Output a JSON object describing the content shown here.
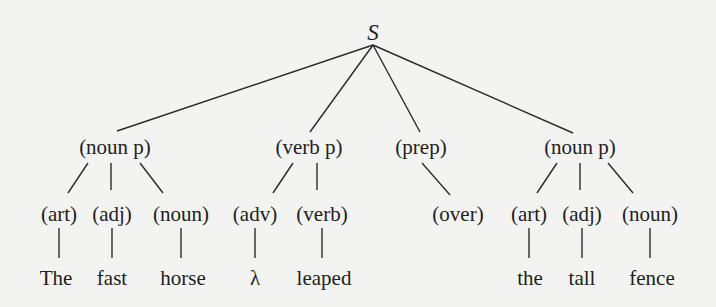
{
  "diagram": {
    "type": "parse-tree",
    "root": {
      "id": "S",
      "label": "S",
      "x": 373,
      "y": 40
    },
    "phrases": [
      {
        "id": "np1",
        "label": "(noun p)",
        "x": 115,
        "y": 154
      },
      {
        "id": "vp",
        "label": "(verb p)",
        "x": 309,
        "y": 154
      },
      {
        "id": "pp",
        "label": "(prep)",
        "x": 421,
        "y": 154
      },
      {
        "id": "np2",
        "label": "(noun p)",
        "x": 580,
        "y": 154
      }
    ],
    "tags": [
      {
        "id": "t1",
        "label": "(art)",
        "x": 59,
        "y": 221,
        "parent": "np1"
      },
      {
        "id": "t2",
        "label": "(adj)",
        "x": 112,
        "y": 221,
        "parent": "np1"
      },
      {
        "id": "t3",
        "label": "(noun)",
        "x": 181,
        "y": 221,
        "parent": "np1"
      },
      {
        "id": "t4",
        "label": "(adv)",
        "x": 255,
        "y": 221,
        "parent": "vp"
      },
      {
        "id": "t5",
        "label": "(verb)",
        "x": 322,
        "y": 221,
        "parent": "vp"
      },
      {
        "id": "t6",
        "label": "(over)",
        "x": 458,
        "y": 221,
        "parent": "pp"
      },
      {
        "id": "t7",
        "label": "(art)",
        "x": 529,
        "y": 221,
        "parent": "np2"
      },
      {
        "id": "t8",
        "label": "(adj)",
        "x": 582,
        "y": 221,
        "parent": "np2"
      },
      {
        "id": "t9",
        "label": "(noun)",
        "x": 650,
        "y": 221,
        "parent": "np2"
      }
    ],
    "words": [
      {
        "id": "w1",
        "label": "The",
        "x": 56,
        "y": 285,
        "parent": "t1"
      },
      {
        "id": "w2",
        "label": "fast",
        "x": 112,
        "y": 285,
        "parent": "t2"
      },
      {
        "id": "w3",
        "label": "horse",
        "x": 183,
        "y": 285,
        "parent": "t3"
      },
      {
        "id": "w4",
        "label": "λ",
        "x": 255,
        "y": 285,
        "parent": "t4"
      },
      {
        "id": "w5",
        "label": "leaped",
        "x": 324,
        "y": 285,
        "parent": "t5"
      },
      {
        "id": "w6",
        "label": "the",
        "x": 530,
        "y": 285,
        "parent": "t7"
      },
      {
        "id": "w7",
        "label": "tall",
        "x": 582,
        "y": 285,
        "parent": "t8"
      },
      {
        "id": "w8",
        "label": "fence",
        "x": 652,
        "y": 285,
        "parent": "t9"
      }
    ],
    "edges": [
      {
        "from": "S",
        "to": "np1",
        "x1": 373,
        "y1": 45,
        "x2": 117,
        "y2": 131
      },
      {
        "from": "S",
        "to": "vp",
        "x1": 373,
        "y1": 45,
        "x2": 310,
        "y2": 132
      },
      {
        "from": "S",
        "to": "pp",
        "x1": 373,
        "y1": 45,
        "x2": 420,
        "y2": 132
      },
      {
        "from": "S",
        "to": "np2",
        "x1": 373,
        "y1": 45,
        "x2": 573,
        "y2": 133
      },
      {
        "from": "np1",
        "to": "t1",
        "x1": 88,
        "y1": 163,
        "x2": 68,
        "y2": 193
      },
      {
        "from": "np1",
        "to": "t2",
        "x1": 111,
        "y1": 163,
        "x2": 111,
        "y2": 190
      },
      {
        "from": "np1",
        "to": "t3",
        "x1": 140,
        "y1": 163,
        "x2": 163,
        "y2": 193
      },
      {
        "from": "vp",
        "to": "t4",
        "x1": 293,
        "y1": 163,
        "x2": 273,
        "y2": 193
      },
      {
        "from": "vp",
        "to": "t5",
        "x1": 317,
        "y1": 163,
        "x2": 317,
        "y2": 190
      },
      {
        "from": "pp",
        "to": "t6",
        "x1": 422,
        "y1": 163,
        "x2": 450,
        "y2": 195
      },
      {
        "from": "np2",
        "to": "t7",
        "x1": 557,
        "y1": 163,
        "x2": 537,
        "y2": 193
      },
      {
        "from": "np2",
        "to": "t8",
        "x1": 580,
        "y1": 163,
        "x2": 580,
        "y2": 190
      },
      {
        "from": "np2",
        "to": "t9",
        "x1": 608,
        "y1": 163,
        "x2": 633,
        "y2": 193
      },
      {
        "from": "t1",
        "to": "w1",
        "x1": 59,
        "y1": 228,
        "x2": 59,
        "y2": 258
      },
      {
        "from": "t2",
        "to": "w2",
        "x1": 112,
        "y1": 228,
        "x2": 112,
        "y2": 258
      },
      {
        "from": "t3",
        "to": "w3",
        "x1": 181,
        "y1": 228,
        "x2": 181,
        "y2": 258
      },
      {
        "from": "t4",
        "to": "w4",
        "x1": 255,
        "y1": 228,
        "x2": 255,
        "y2": 258
      },
      {
        "from": "t5",
        "to": "w5",
        "x1": 322,
        "y1": 228,
        "x2": 322,
        "y2": 258
      },
      {
        "from": "t7",
        "to": "w6",
        "x1": 529,
        "y1": 228,
        "x2": 529,
        "y2": 258
      },
      {
        "from": "t8",
        "to": "w7",
        "x1": 582,
        "y1": 228,
        "x2": 582,
        "y2": 258
      },
      {
        "from": "t9",
        "to": "w8",
        "x1": 650,
        "y1": 228,
        "x2": 650,
        "y2": 258
      }
    ]
  }
}
